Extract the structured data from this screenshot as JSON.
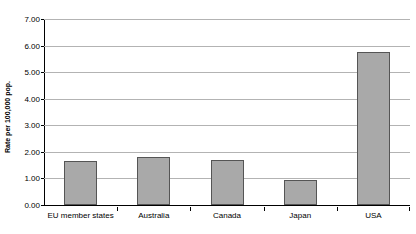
{
  "chart_data": {
    "type": "bar",
    "title": "",
    "subtitle": "",
    "xlabel": "",
    "ylabel": "Rate per 100,000 pop.",
    "categories": [
      "EU member states",
      "Australia",
      "Canada",
      "Japan",
      "USA"
    ],
    "values": [
      1.65,
      1.8,
      1.7,
      0.93,
      5.75
    ],
    "ylim": [
      0.0,
      7.0
    ],
    "ytick_values": [
      0.0,
      1.0,
      2.0,
      3.0,
      4.0,
      5.0,
      6.0,
      7.0
    ],
    "ytick_labels": [
      "0.00",
      "1.00",
      "2.00",
      "3.00",
      "4.00",
      "5.00",
      "6.00",
      "7.00"
    ],
    "grid": true,
    "grid_axis": "y",
    "legend": false,
    "legend_position": "none",
    "series": [
      {
        "name": "Rate per 100,000 pop.",
        "values": [
          1.65,
          1.8,
          1.7,
          0.93,
          5.75
        ],
        "color": "#a9a9a9",
        "border_color": "#555555"
      }
    ],
    "colors": {
      "bar_fill": "#a9a9a9",
      "bar_border": "#555555",
      "gridline": "#b3b3b3",
      "axis": "#000000",
      "text": "#000000",
      "background": "#ffffff"
    }
  }
}
